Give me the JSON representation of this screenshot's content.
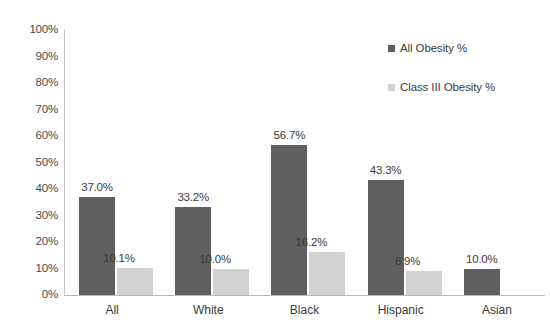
{
  "chart_data": {
    "type": "bar",
    "title": "",
    "subtitle": "",
    "xlabel": "",
    "ylabel": "",
    "categories": [
      "All",
      "White",
      "Black",
      "Hispanic",
      "Asian"
    ],
    "series": [
      {
        "name": "All Obesity %",
        "color": "#5f5f5f",
        "values": [
          37.0,
          33.2,
          56.7,
          43.3,
          10.0
        ],
        "labels": [
          "37.0%",
          "33.2%",
          "56.7%",
          "43.3%",
          "10.0%"
        ]
      },
      {
        "name": "Class III Obesity %",
        "color": "#d2d2d2",
        "values": [
          10.1,
          10.0,
          16.2,
          8.9,
          null
        ],
        "labels": [
          "10.1%",
          "10.0%",
          "16.2%",
          "8.9%",
          ""
        ]
      }
    ],
    "ylim": [
      0,
      100
    ],
    "yticks": [
      100,
      90,
      80,
      70,
      60,
      50,
      40,
      30,
      20,
      10,
      0
    ],
    "ytick_labels": [
      "100%",
      "90%",
      "80%",
      "70%",
      "60%",
      "50%",
      "40%",
      "30%",
      "20%",
      "10%",
      "0%"
    ],
    "grid": false,
    "legend_position": "top-right"
  }
}
